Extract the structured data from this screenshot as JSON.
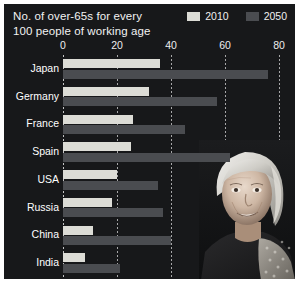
{
  "title": {
    "line1": "No. of over-65s for every",
    "line2": "100 people of working age"
  },
  "legend": {
    "position": "top-right",
    "items": [
      {
        "label": "2010",
        "color": "#dcdcd6",
        "swatch_name": "legend-swatch-2010"
      },
      {
        "label": "2050",
        "color": "#4a4c50",
        "swatch_name": "legend-swatch-2050"
      }
    ]
  },
  "colors": {
    "background": "#17181a",
    "page": "#ffffff",
    "series_2010": "#dcdcd6",
    "series_2050": "#4a4c50",
    "text": "#f2f2f2",
    "gridline": "#ffffff"
  },
  "axis": {
    "ticks": [
      "0",
      "20",
      "40",
      "60",
      "80"
    ],
    "tick_values": [
      0,
      20,
      40,
      60,
      80
    ],
    "min": 0,
    "max": 80
  },
  "photo": {
    "caption": "elderly-woman-portrait",
    "alt": "Photograph of a smiling elderly woman with white hair"
  },
  "chart_data": {
    "type": "bar",
    "orientation": "horizontal",
    "title": "No. of over-65s for every 100 people of working age",
    "xlabel": "",
    "ylabel": "",
    "xlim": [
      0,
      80
    ],
    "grid": true,
    "legend_position": "top-right",
    "categories": [
      "Japan",
      "Germany",
      "France",
      "Spain",
      "USA",
      "Russia",
      "China",
      "India"
    ],
    "series": [
      {
        "name": "2010",
        "color": "#dcdcd6",
        "values": [
          36,
          32,
          26,
          25,
          20,
          18,
          11,
          8
        ]
      },
      {
        "name": "2050",
        "color": "#4a4c50",
        "values": [
          76,
          57,
          45,
          62,
          35,
          37,
          40,
          21
        ]
      }
    ]
  }
}
